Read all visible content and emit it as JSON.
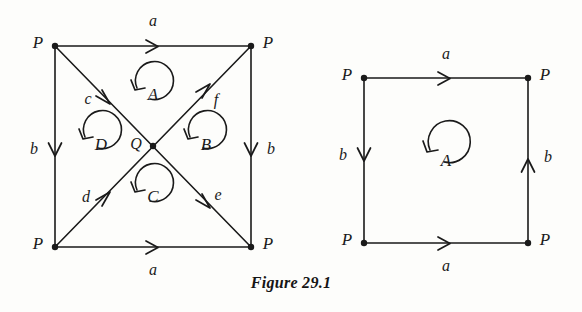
{
  "figure": {
    "caption": "Figure 29.1",
    "stroke_color": "#1a1a1a",
    "background_color": "#fdfdfb"
  },
  "diagrams": [
    {
      "name": "square-with-diagonals",
      "vertices": [
        {
          "label": "P",
          "position": "top-left"
        },
        {
          "label": "P",
          "position": "top-right"
        },
        {
          "label": "P",
          "position": "bottom-left"
        },
        {
          "label": "P",
          "position": "bottom-right"
        }
      ],
      "center_vertex": {
        "label": "Q"
      },
      "edges": [
        {
          "label": "a",
          "side": "top",
          "direction": "right"
        },
        {
          "label": "a",
          "side": "bottom",
          "direction": "right"
        },
        {
          "label": "b",
          "side": "left",
          "direction": "down"
        },
        {
          "label": "b",
          "side": "right",
          "direction": "down"
        }
      ],
      "diagonals": [
        {
          "label": "c",
          "from": "top-left",
          "to": "center",
          "direction": "down-right"
        },
        {
          "label": "f",
          "from": "center",
          "to": "top-right",
          "direction": "up-right"
        },
        {
          "label": "d",
          "from": "bottom-left",
          "to": "center",
          "direction": "up-right"
        },
        {
          "label": "e",
          "from": "center",
          "to": "bottom-right",
          "direction": "down-right"
        }
      ],
      "regions": [
        {
          "label": "A",
          "position": "top",
          "orientation": "counterclockwise"
        },
        {
          "label": "B",
          "position": "right",
          "orientation": "counterclockwise"
        },
        {
          "label": "C",
          "position": "bottom",
          "orientation": "counterclockwise"
        },
        {
          "label": "D",
          "position": "left",
          "orientation": "counterclockwise"
        }
      ]
    },
    {
      "name": "plain-square",
      "vertices": [
        {
          "label": "P",
          "position": "top-left"
        },
        {
          "label": "P",
          "position": "top-right"
        },
        {
          "label": "P",
          "position": "bottom-left"
        },
        {
          "label": "P",
          "position": "bottom-right"
        }
      ],
      "edges": [
        {
          "label": "a",
          "side": "top",
          "direction": "right"
        },
        {
          "label": "a",
          "side": "bottom",
          "direction": "right"
        },
        {
          "label": "b",
          "side": "left",
          "direction": "down"
        },
        {
          "label": "b",
          "side": "right",
          "direction": "up"
        }
      ],
      "regions": [
        {
          "label": "A",
          "position": "center",
          "orientation": "counterclockwise"
        }
      ]
    }
  ],
  "labels": {
    "left": {
      "v_tl": "P",
      "v_tr": "P",
      "v_bl": "P",
      "v_br": "P",
      "center": "Q",
      "edge_top": "a",
      "edge_bottom": "a",
      "edge_left": "b",
      "edge_right": "b",
      "diag_c": "c",
      "diag_f": "f",
      "diag_d": "d",
      "diag_e": "e",
      "region_a": "A",
      "region_b": "B",
      "region_c": "C",
      "region_d": "D"
    },
    "right": {
      "v_tl": "P",
      "v_tr": "P",
      "v_bl": "P",
      "v_br": "P",
      "edge_top": "a",
      "edge_bottom": "a",
      "edge_left": "b",
      "edge_right": "b",
      "region_a": "A"
    }
  }
}
